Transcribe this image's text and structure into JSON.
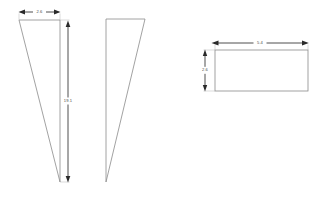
{
  "drawing": {
    "background_color": "#ffffff",
    "line_color": "#8a8a8a",
    "dimension_color": "#3a3a3a",
    "shapes": [
      {
        "id": "left-triangle",
        "type": "triangle",
        "description": "slender right triangle, apex at bottom right",
        "points": "19,20 60,20 60,182"
      },
      {
        "id": "middle-triangle",
        "type": "triangle",
        "description": "slender right triangle, apex at bottom left, mirrored",
        "points": "106,19 145,19 106,182"
      },
      {
        "id": "right-rectangle",
        "type": "rectangle",
        "description": "horizontal rectangle",
        "x": 215,
        "y": 50,
        "width": 93,
        "height": 41
      }
    ],
    "dimensions": [
      {
        "id": "left-width",
        "label": "2.6",
        "orientation": "horizontal",
        "x1": 19,
        "x2": 60,
        "y": 12,
        "label_x": 39,
        "label_y": 11
      },
      {
        "id": "left-height",
        "label": "19.1",
        "orientation": "vertical",
        "x": 68,
        "y1": 21,
        "y2": 182,
        "label_x": 68,
        "label_y": 101
      },
      {
        "id": "rect-width",
        "label": "5.4",
        "orientation": "horizontal",
        "x1": 212,
        "x2": 308,
        "y": 43,
        "label_x": 260,
        "label_y": 42
      },
      {
        "id": "rect-height",
        "label": "2.6",
        "orientation": "vertical",
        "x": 205,
        "y1": 50,
        "y2": 91,
        "label_x": 205,
        "label_y": 70
      }
    ]
  }
}
